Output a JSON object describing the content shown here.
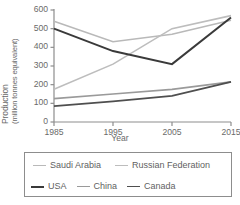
{
  "chart_data": {
    "type": "line",
    "title": "",
    "xlabel": "Year",
    "ylabel_line1": "Production",
    "ylabel_line2": "(million tonnes equivalent)",
    "x": [
      1985,
      1995,
      2005,
      2015
    ],
    "xtick_labels": [
      "1985",
      "1995",
      "2005",
      "2015"
    ],
    "ytick_labels": [
      "0",
      "100",
      "200",
      "300",
      "400",
      "500",
      "600"
    ],
    "ytick_values": [
      0,
      100,
      200,
      300,
      400,
      500,
      600
    ],
    "ylim": [
      0,
      600
    ],
    "xlim": [
      1985,
      2015
    ],
    "grid": false,
    "legend_position": "below",
    "series": [
      {
        "name": "Saudi Arabia",
        "color": "#b9b9b9",
        "width": 1.6,
        "values": [
          540,
          430,
          470,
          545
        ]
      },
      {
        "name": "Russian Federation",
        "color": "#bdbdbd",
        "width": 1.6,
        "values": [
          175,
          310,
          500,
          570
        ]
      },
      {
        "name": "USA",
        "color": "#3a3a3a",
        "width": 2.0,
        "values": [
          500,
          380,
          310,
          560
        ]
      },
      {
        "name": "China",
        "color": "#9a9a9a",
        "width": 1.6,
        "values": [
          125,
          150,
          175,
          215
        ]
      },
      {
        "name": "Canada",
        "color": "#4f4f4f",
        "width": 1.8,
        "values": [
          85,
          110,
          140,
          215
        ]
      }
    ]
  },
  "axes": {
    "axis_color": "#8d8d8d",
    "text_color": "#6a6a6a"
  },
  "legend": {
    "border_color": "#8d8d8d",
    "rows": [
      [
        "Saudi Arabia",
        "Russian Federation"
      ],
      [
        "USA",
        "China",
        "Canada"
      ]
    ]
  }
}
